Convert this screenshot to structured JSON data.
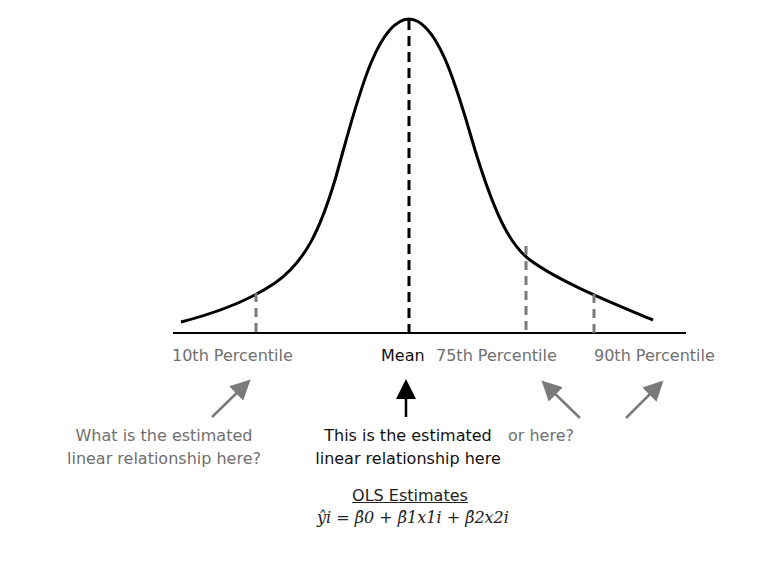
{
  "diagram": {
    "curve": "bell-shaped density",
    "labels": {
      "p10": "10th Percentile",
      "mean": "Mean",
      "p75": "75th Percentile",
      "p90": "90th Percentile"
    },
    "annotations": {
      "left_line1": "What is the estimated",
      "left_line2": "linear relationship here?",
      "center_line1": "This is the estimated",
      "center_line2": "linear relationship here",
      "right": "or here?"
    },
    "ols": {
      "title": "OLS Estimates",
      "equation": "ŷi = β̂0 + β̂1x1i + β̂2x2i"
    },
    "colors": {
      "curve": "#000000",
      "mean_line": "#000000",
      "percentile_lines": "#7a7a7a",
      "percentile_text": "#707070",
      "arrows_gray": "#7a7a7a"
    }
  }
}
